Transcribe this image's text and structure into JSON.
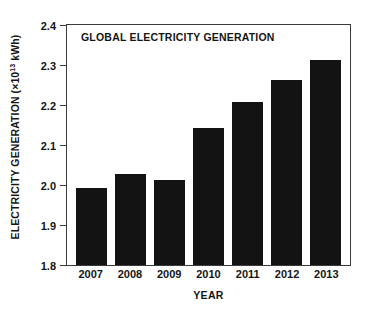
{
  "chart_data": {
    "type": "bar",
    "title": "GLOBAL ELECTRICITY GENERATION",
    "xlabel": "YEAR",
    "ylabel": "ELECTRICITY GENERATION (×10¹³ kWh)",
    "ylabel_prefix": "ELECTRICITY GENERATION (×10",
    "ylabel_exponent": "13",
    "ylabel_suffix": " kWh)",
    "categories": [
      "2007",
      "2008",
      "2009",
      "2010",
      "2011",
      "2012",
      "2013"
    ],
    "values": [
      1.993,
      2.027,
      2.013,
      2.143,
      2.208,
      2.262,
      2.312
    ],
    "ylim": [
      1.8,
      2.4
    ],
    "yticks": [
      "2.4",
      "2.3",
      "2.2",
      "2.1",
      "2.0",
      "1.9",
      "1.8"
    ],
    "ytick_values": [
      2.4,
      2.3,
      2.2,
      2.1,
      2.0,
      1.9,
      1.8
    ],
    "grid": false,
    "legend": null,
    "bar_color": "#131313",
    "axis_color": "#3a3a3a",
    "background_color": "#ffffff"
  }
}
